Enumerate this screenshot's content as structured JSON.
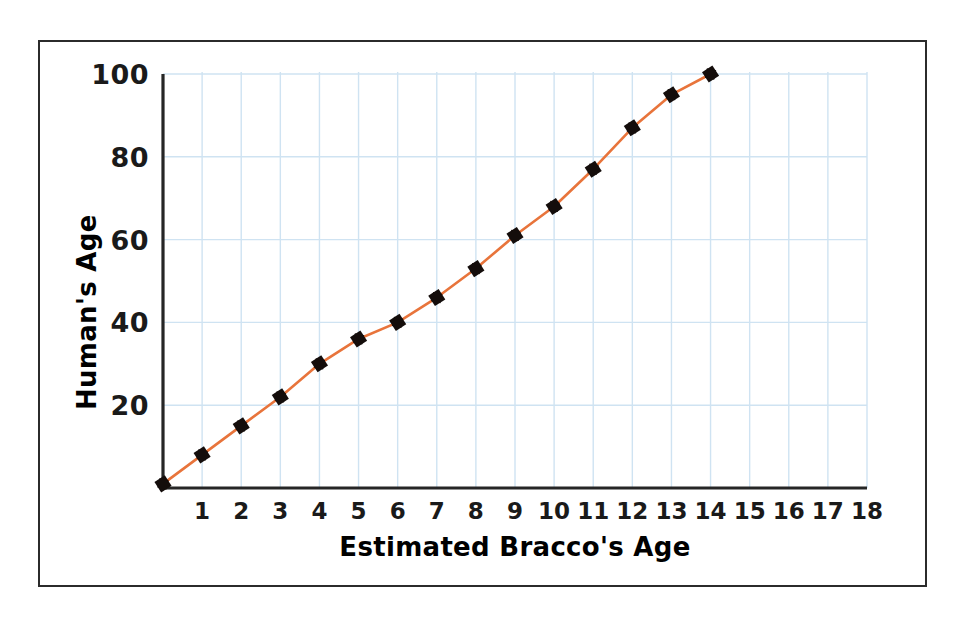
{
  "chart_data": {
    "type": "line",
    "title": "",
    "xlabel": "Estimated Bracco's Age",
    "ylabel": "Human's Age",
    "xlim": [
      0,
      18
    ],
    "ylim": [
      0,
      100
    ],
    "grid": true,
    "legend": "none",
    "x_ticks": [
      "1",
      "2",
      "3",
      "4",
      "5",
      "6",
      "7",
      "8",
      "9",
      "10",
      "11",
      "12",
      "13",
      "14",
      "15",
      "16",
      "17",
      "18"
    ],
    "y_ticks": [
      "20",
      "40",
      "60",
      "80",
      "100"
    ],
    "marker": "black-diamond",
    "line_color": "#E8743B",
    "marker_color": "#140D0B",
    "grid_color": "#CFE3F2",
    "axis_color": "#262626",
    "series": [
      {
        "name": "Human's Age",
        "x": [
          0,
          1,
          2,
          3,
          4,
          5,
          6,
          7,
          8,
          9,
          10,
          11,
          12,
          13,
          14
        ],
        "values": [
          1,
          8,
          15,
          22,
          30,
          36,
          40,
          46,
          53,
          61,
          68,
          77,
          87,
          95,
          100
        ]
      }
    ]
  },
  "axes": {
    "y_title": "Human's Age",
    "x_title": "Estimated Bracco's Age"
  }
}
